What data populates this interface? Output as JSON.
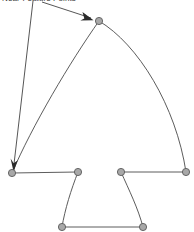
{
  "figure": {
    "type": "diagram",
    "title": "",
    "background_color": "#ffffff",
    "width": 194,
    "height": 232,
    "annotation": {
      "label": "Near-Feature Points",
      "text_color": "#3a3a3a",
      "clipped_at_top": true,
      "leader_lines": 2,
      "arrow_color": "#2b2b2b"
    },
    "style": {
      "edge_color": "#4a4a4a",
      "edge_width": 0.9,
      "node_fill": "#a8a8a8",
      "node_stroke": "#5a5a5a",
      "node_radius": 3.6
    },
    "nodes": [
      {
        "id": "apex",
        "name": "apex-node",
        "x": 99,
        "y": 21
      },
      {
        "id": "left_base",
        "name": "left-base-node",
        "x": 12,
        "y": 173
      },
      {
        "id": "inner_left",
        "name": "inner-left-top-node",
        "x": 78,
        "y": 172
      },
      {
        "id": "inner_right",
        "name": "inner-right-top-node",
        "x": 121,
        "y": 172
      },
      {
        "id": "right_base",
        "name": "right-base-node",
        "x": 186,
        "y": 172
      },
      {
        "id": "bottom_left",
        "name": "bottom-left-node",
        "x": 62,
        "y": 227
      },
      {
        "id": "bottom_right",
        "name": "bottom-right-node",
        "x": 143,
        "y": 227
      }
    ],
    "edges": [
      {
        "id": "left_arc",
        "name": "left-outer-arc",
        "from": "apex",
        "to": "left_base",
        "curve": "convex-left",
        "path": "M 99 21 C 70 62 32 126 12 173"
      },
      {
        "id": "right_arc",
        "name": "right-outer-arc",
        "from": "apex",
        "to": "right_base",
        "curve": "convex-right",
        "path": "M 99 21 C 138 44 176 106 186 172"
      },
      {
        "id": "left_shelf",
        "name": "left-shelf-edge",
        "from": "left_base",
        "to": "inner_left",
        "curve": "straight",
        "path": "M 12 173 L 78 172"
      },
      {
        "id": "right_shelf",
        "name": "right-shelf-edge",
        "from": "inner_right",
        "to": "right_base",
        "curve": "straight",
        "path": "M 121 172 L 186 172"
      },
      {
        "id": "left_inner_arc",
        "name": "left-inner-arc",
        "from": "inner_left",
        "to": "bottom_left",
        "curve": "convex-left",
        "path": "M 78 172 C 71 190 65 209 62 227"
      },
      {
        "id": "right_inner_arc",
        "name": "right-inner-arc",
        "from": "inner_right",
        "to": "bottom_right",
        "curve": "convex-right",
        "path": "M 121 172 C 129 190 138 208 143 227"
      },
      {
        "id": "bottom_edge",
        "name": "bottom-edge",
        "from": "bottom_left",
        "to": "bottom_right",
        "curve": "straight",
        "path": "M 62 227 L 143 227"
      }
    ],
    "leaders": [
      {
        "id": "leader_apex",
        "name": "leader-line-to-apex",
        "path": "M 42 3 L 92 19",
        "arrow_at": {
          "x": 92,
          "y": 19
        },
        "angle_deg": 18
      },
      {
        "id": "leader_base",
        "name": "leader-line-to-left-base",
        "path": "M 33 2 L 15 166",
        "arrow_at": {
          "x": 15,
          "y": 167
        },
        "angle_deg": 96
      }
    ]
  }
}
